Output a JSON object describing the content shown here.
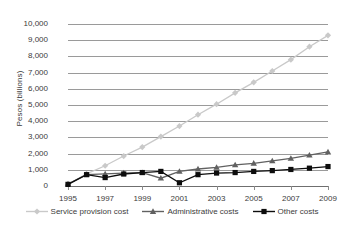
{
  "chart_data": {
    "type": "line",
    "title": "",
    "xlabel": "",
    "ylabel": "Pesos (billions)",
    "x": [
      1995,
      1996,
      1997,
      1998,
      1999,
      2000,
      2001,
      2002,
      2003,
      2004,
      2005,
      2006,
      2007,
      2008,
      2009
    ],
    "xlim": [
      1995,
      2009
    ],
    "ylim": [
      0,
      10000
    ],
    "ytick_labels": [
      "10,000",
      "9,000",
      "8,000",
      "7,000",
      "6,000",
      "5,000",
      "4,000",
      "3,000",
      "2,000",
      "1,000",
      "0"
    ],
    "ytick_values": [
      10000,
      9000,
      8000,
      7000,
      6000,
      5000,
      4000,
      3000,
      2000,
      1000,
      0
    ],
    "xtick_labels": [
      "1995",
      "1997",
      "1999",
      "2001",
      "2003",
      "2005",
      "2007",
      "2009"
    ],
    "xtick_values": [
      1995,
      1997,
      1999,
      2001,
      2003,
      2005,
      2007,
      2009
    ],
    "grid": true,
    "legend_position": "bottom",
    "series": [
      {
        "name": "Service provision cost",
        "marker": "diamond",
        "color": "#c9c9c9",
        "values": [
          100,
          750,
          1250,
          1850,
          2400,
          3050,
          3700,
          4400,
          5050,
          5750,
          6400,
          7100,
          7800,
          8600,
          9300
        ]
      },
      {
        "name": "Administrative costs",
        "marker": "triangle",
        "color": "#616161",
        "values": [
          120,
          700,
          750,
          800,
          820,
          480,
          900,
          1050,
          1150,
          1300,
          1400,
          1550,
          1700,
          1900,
          2100
        ]
      },
      {
        "name": "Other costs",
        "marker": "square",
        "color": "#0d0d0d",
        "values": [
          100,
          700,
          520,
          740,
          830,
          900,
          200,
          700,
          800,
          830,
          900,
          950,
          1020,
          1100,
          1200
        ]
      }
    ]
  },
  "legend": {
    "items": [
      {
        "label": "Service provision cost",
        "color": "#c9c9c9",
        "marker": "diamond"
      },
      {
        "label": "Administrative costs",
        "color": "#616161",
        "marker": "triangle"
      },
      {
        "label": "Other costs",
        "color": "#0d0d0d",
        "marker": "square"
      }
    ]
  },
  "colors": {
    "gridline": "#9a9a9a",
    "axis": "#6f6f6f",
    "text": "#3b3b3b",
    "background": "#ffffff"
  }
}
